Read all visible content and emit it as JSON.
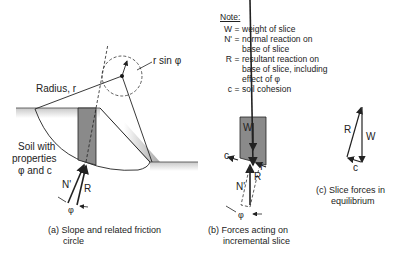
{
  "note": {
    "title": "Note:",
    "items": [
      {
        "key": "W",
        "lines": [
          "weight of slice"
        ]
      },
      {
        "key": "N'",
        "lines": [
          "normal reaction on",
          "base of slice"
        ]
      },
      {
        "key": "R",
        "lines": [
          "resultant reaction on",
          "base of slice, including",
          "effect of φ"
        ]
      },
      {
        "key": "c",
        "lines": [
          "soil cohesion"
        ]
      }
    ]
  },
  "panel_a": {
    "radius_label": "Radius, r",
    "rsin_label": "r sin φ",
    "soil_label_1": "Soil with",
    "soil_label_2": "properties",
    "soil_label_3": "φ and c",
    "n_label": "N'",
    "r_label": "R",
    "phi_label": "φ",
    "caption_1": "(a)  Slope and related friction",
    "caption_2": "circle"
  },
  "panel_b": {
    "w_label": "W",
    "c_label": "c",
    "f_label": "f",
    "n_label": "N'",
    "r_label": "R",
    "phi_label": "φ",
    "caption_1": "(b)  Forces acting on",
    "caption_2": "incremental slice"
  },
  "panel_c": {
    "r_label": "R",
    "w_label": "W",
    "c_label": "c",
    "caption_1": "(c)  Slice forces in",
    "caption_2": "equilibrium"
  }
}
